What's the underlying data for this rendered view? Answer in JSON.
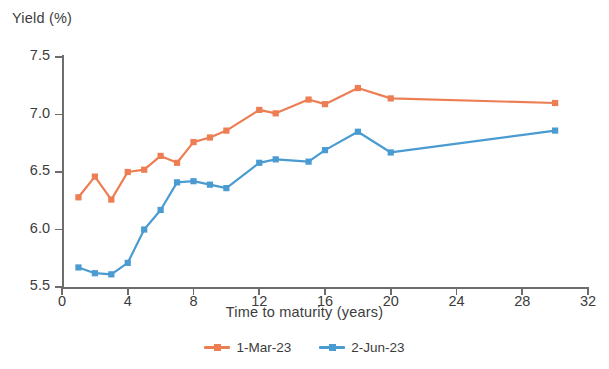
{
  "chart_data": {
    "type": "line",
    "title": "",
    "xlabel": "Time to maturity (years)",
    "ylabel": "Yield (%)",
    "xlim": [
      0,
      32
    ],
    "ylim": [
      5.5,
      7.5
    ],
    "xticks": [
      0,
      4,
      8,
      12,
      16,
      20,
      24,
      28,
      32
    ],
    "yticks": [
      "5.5",
      "6.0",
      "6.5",
      "7.0",
      "7.5"
    ],
    "grid": false,
    "legend_position": "bottom-center",
    "markers": "square",
    "series": [
      {
        "name": "1-Mar-23",
        "color": "#ED7D52",
        "x": [
          1,
          2,
          3,
          4,
          5,
          6,
          7,
          8,
          9,
          10,
          12,
          13,
          15,
          16,
          18,
          20,
          30
        ],
        "values": [
          6.28,
          6.46,
          6.26,
          6.5,
          6.52,
          6.64,
          6.58,
          6.76,
          6.8,
          6.86,
          7.04,
          7.01,
          7.13,
          7.09,
          7.23,
          7.14,
          7.1
        ]
      },
      {
        "name": "2-Jun-23",
        "color": "#4A9BD1",
        "x": [
          1,
          2,
          3,
          4,
          5,
          6,
          7,
          8,
          9,
          10,
          12,
          13,
          15,
          16,
          18,
          20,
          30
        ],
        "values": [
          5.67,
          5.62,
          5.61,
          5.71,
          6.0,
          6.17,
          6.41,
          6.42,
          6.39,
          6.36,
          6.58,
          6.61,
          6.59,
          6.69,
          6.85,
          6.67,
          6.86
        ]
      }
    ]
  },
  "legend": {
    "items": [
      {
        "label": "1-Mar-23",
        "color": "#ED7D52"
      },
      {
        "label": "2-Jun-23",
        "color": "#4A9BD1"
      }
    ]
  }
}
